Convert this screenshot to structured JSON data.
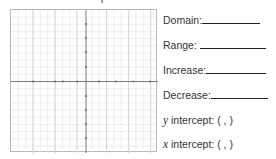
{
  "worksheet": {
    "top_fragment": "T",
    "graph": {
      "type": "coordinate-plane",
      "x_range": [
        -4,
        4
      ],
      "y_range": [
        -4,
        4
      ],
      "grid_minor_divisions": 20,
      "axis_color": "#7a7a7a",
      "grid_color": "#dcdcdc",
      "tick_mark_color": "#555555"
    },
    "fields": [
      {
        "label": "Domain:",
        "value": ""
      },
      {
        "label": "Range:",
        "value": ""
      },
      {
        "label": "Increase:",
        "value": ""
      },
      {
        "label": "Decrease:",
        "value": ""
      },
      {
        "label_var": "y",
        "label": " intercept: (  ,  )",
        "value": ""
      },
      {
        "label_var": "x",
        "label": " intercept: (  ,  )",
        "value": ""
      }
    ]
  }
}
